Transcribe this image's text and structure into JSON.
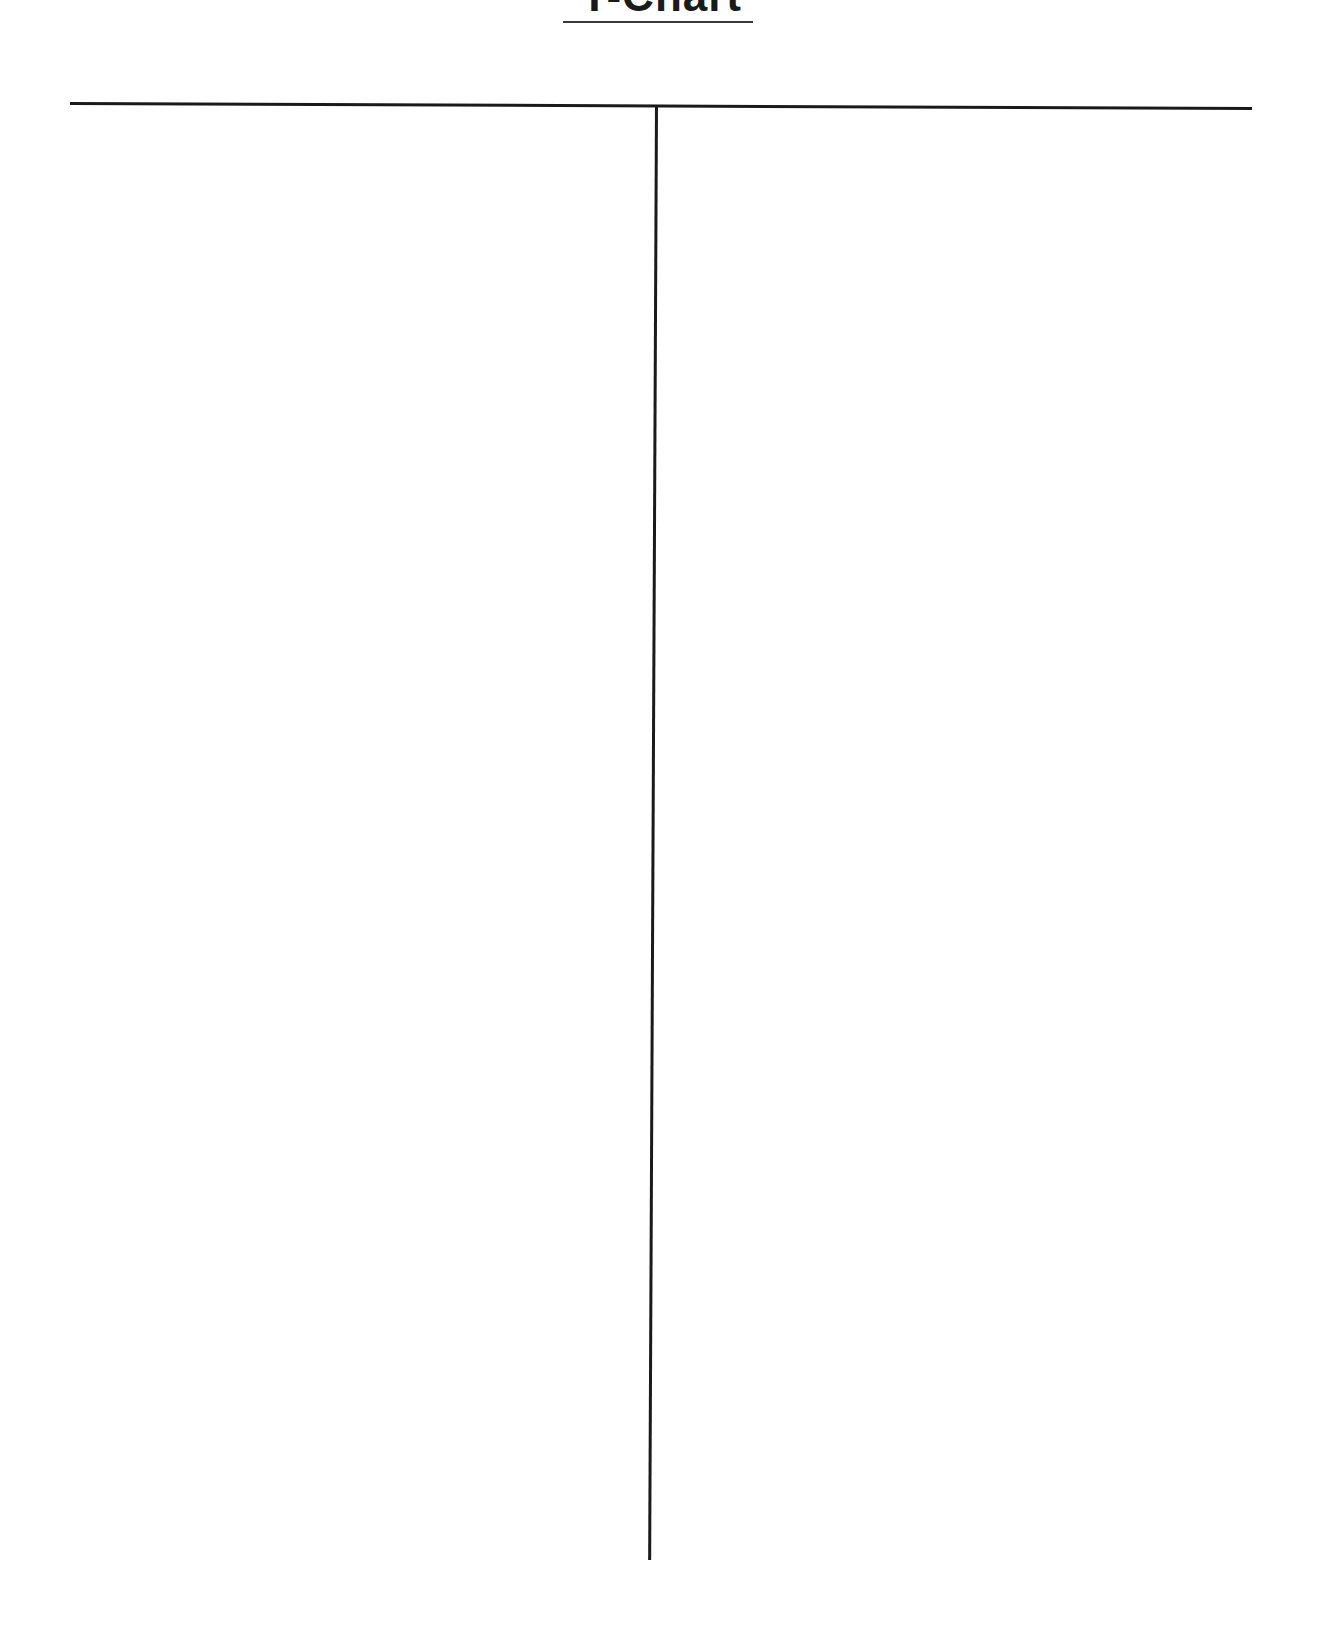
{
  "document": {
    "title": "T-Chart",
    "columns": [
      {
        "heading": "",
        "items": []
      },
      {
        "heading": "",
        "items": []
      }
    ]
  },
  "colors": {
    "line": "#1a1a1a",
    "background": "#ffffff"
  }
}
